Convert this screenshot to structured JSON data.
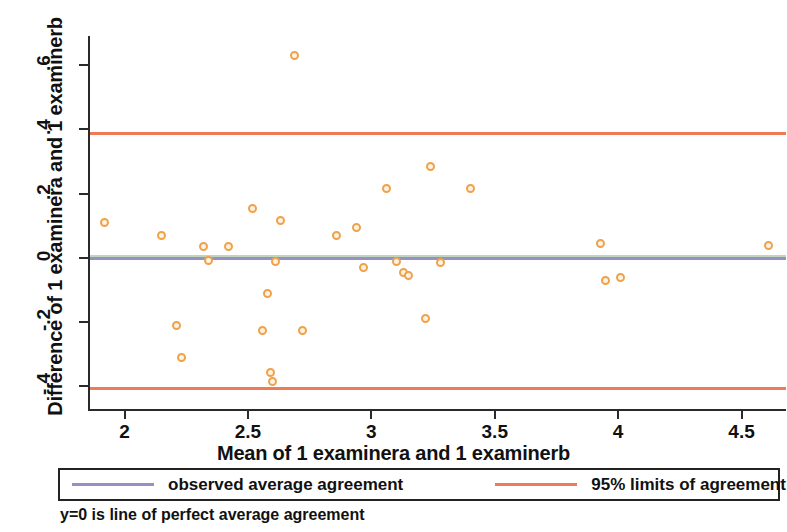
{
  "chart_data": {
    "type": "scatter",
    "title": "",
    "xlabel": "Mean of 1 examinera and 1 examinerb",
    "ylabel": "Difference of 1 examinera and 1 examinerb",
    "xlim": [
      1.86,
      4.68
    ],
    "ylim": [
      -0.47,
      0.69
    ],
    "xticks": [
      "2",
      "2.5",
      "3",
      "3.5",
      "4",
      "4.5"
    ],
    "xtick_values": [
      2,
      2.5,
      3,
      3.5,
      4,
      4.5
    ],
    "yticks": [
      ".6",
      ".4",
      ".2",
      "0",
      "-.2",
      "-.4"
    ],
    "ytick_values": [
      0.6,
      0.4,
      0.2,
      0,
      -0.2,
      -0.4
    ],
    "grid": false,
    "legend_position": "bottom",
    "series": [
      {
        "name": "differences",
        "marker": "open-circle",
        "color": "#f0a14b",
        "points": [
          {
            "x": 1.92,
            "y": 0.11
          },
          {
            "x": 2.15,
            "y": 0.07
          },
          {
            "x": 2.21,
            "y": -0.21
          },
          {
            "x": 2.23,
            "y": -0.31
          },
          {
            "x": 2.32,
            "y": 0.035
          },
          {
            "x": 2.34,
            "y": -0.007
          },
          {
            "x": 2.42,
            "y": 0.035
          },
          {
            "x": 2.52,
            "y": 0.155
          },
          {
            "x": 2.56,
            "y": -0.225
          },
          {
            "x": 2.58,
            "y": -0.11
          },
          {
            "x": 2.59,
            "y": -0.355
          },
          {
            "x": 2.6,
            "y": -0.385
          },
          {
            "x": 2.61,
            "y": -0.012
          },
          {
            "x": 2.63,
            "y": 0.115
          },
          {
            "x": 2.69,
            "y": 0.63
          },
          {
            "x": 2.72,
            "y": -0.225
          },
          {
            "x": 2.86,
            "y": 0.07
          },
          {
            "x": 2.94,
            "y": 0.095
          },
          {
            "x": 2.97,
            "y": -0.03
          },
          {
            "x": 3.06,
            "y": 0.215
          },
          {
            "x": 3.1,
            "y": -0.012
          },
          {
            "x": 3.13,
            "y": -0.045
          },
          {
            "x": 3.15,
            "y": -0.055
          },
          {
            "x": 3.22,
            "y": -0.19
          },
          {
            "x": 3.24,
            "y": 0.285
          },
          {
            "x": 3.28,
            "y": -0.015
          },
          {
            "x": 3.4,
            "y": 0.215
          },
          {
            "x": 3.93,
            "y": 0.045
          },
          {
            "x": 3.95,
            "y": -0.07
          },
          {
            "x": 4.01,
            "y": -0.06
          },
          {
            "x": 4.61,
            "y": 0.04
          }
        ]
      }
    ],
    "reference_lines": [
      {
        "name": "upper-limit-of-agreement",
        "y": 0.389,
        "color": "#ee7b55",
        "label": "95% limits of agreement"
      },
      {
        "name": "observed-average-agreement",
        "y": 0.0,
        "color": "#9b8ec4",
        "label": "observed average agreement"
      },
      {
        "name": "lower-limit-of-agreement",
        "y": -0.406,
        "color": "#ee7b55",
        "label": "95% limits of agreement"
      }
    ]
  },
  "axes": {
    "x_title": "Mean of 1 examinera and 1 examinerb",
    "y_title": "Difference of 1 examinera and 1 examinerb"
  },
  "legend": {
    "entries": [
      {
        "label": "observed average agreement",
        "color": "#9b8ec4"
      },
      {
        "label": "95% limits of agreement",
        "color": "#ee7b55"
      }
    ]
  },
  "footnote": "y=0 is line of perfect average agreement"
}
